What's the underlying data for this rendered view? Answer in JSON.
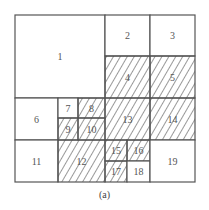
{
  "caption": "(a)",
  "colors": {
    "line": "#555555",
    "hatch": "#333333",
    "background": "#ffffff"
  },
  "cells": [
    {
      "id": "1",
      "label": "1",
      "x": 15,
      "y": 15,
      "w": 90,
      "h": 83,
      "hatched": false
    },
    {
      "id": "2",
      "label": "2",
      "x": 105,
      "y": 15,
      "w": 45,
      "h": 41,
      "hatched": false
    },
    {
      "id": "3",
      "label": "3",
      "x": 150,
      "y": 15,
      "w": 45,
      "h": 41,
      "hatched": false
    },
    {
      "id": "4",
      "label": "4",
      "x": 105,
      "y": 56,
      "w": 45,
      "h": 42,
      "hatched": true
    },
    {
      "id": "5",
      "label": "5",
      "x": 150,
      "y": 56,
      "w": 45,
      "h": 42,
      "hatched": true
    },
    {
      "id": "6",
      "label": "6",
      "x": 15,
      "y": 98,
      "w": 43,
      "h": 42,
      "hatched": false
    },
    {
      "id": "7",
      "label": "7",
      "x": 58,
      "y": 98,
      "w": 20,
      "h": 20,
      "hatched": false
    },
    {
      "id": "8",
      "label": "8",
      "x": 78,
      "y": 98,
      "w": 27,
      "h": 20,
      "hatched": true
    },
    {
      "id": "9",
      "label": "9",
      "x": 58,
      "y": 118,
      "w": 20,
      "h": 22,
      "hatched": true
    },
    {
      "id": "10",
      "label": "10",
      "x": 78,
      "y": 118,
      "w": 27,
      "h": 22,
      "hatched": true
    },
    {
      "id": "11",
      "label": "11",
      "x": 15,
      "y": 140,
      "w": 43,
      "h": 42,
      "hatched": false
    },
    {
      "id": "12",
      "label": "12",
      "x": 58,
      "y": 140,
      "w": 47,
      "h": 42,
      "hatched": true
    },
    {
      "id": "13",
      "label": "13",
      "x": 105,
      "y": 98,
      "w": 45,
      "h": 42,
      "hatched": true
    },
    {
      "id": "14",
      "label": "14",
      "x": 150,
      "y": 98,
      "w": 45,
      "h": 42,
      "hatched": true
    },
    {
      "id": "15",
      "label": "15",
      "x": 105,
      "y": 140,
      "w": 22,
      "h": 21,
      "hatched": true
    },
    {
      "id": "16",
      "label": "16",
      "x": 127,
      "y": 140,
      "w": 23,
      "h": 21,
      "hatched": true
    },
    {
      "id": "17",
      "label": "17",
      "x": 105,
      "y": 161,
      "w": 22,
      "h": 21,
      "hatched": true
    },
    {
      "id": "18",
      "label": "18",
      "x": 127,
      "y": 161,
      "w": 23,
      "h": 21,
      "hatched": false
    },
    {
      "id": "19",
      "label": "19",
      "x": 150,
      "y": 140,
      "w": 45,
      "h": 42,
      "hatched": false
    }
  ]
}
